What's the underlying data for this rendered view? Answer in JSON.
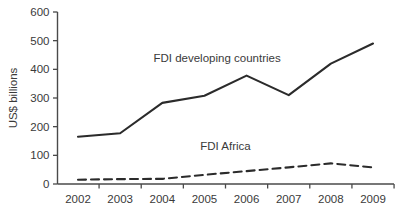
{
  "chart_data": {
    "type": "line",
    "title": "",
    "subtitle": "",
    "xlabel": "",
    "ylabel": "US$ billions",
    "categories": [
      "2002",
      "2003",
      "2004",
      "2005",
      "2006",
      "2007",
      "2008",
      "2009"
    ],
    "x": [
      2002,
      2003,
      2004,
      2005,
      2006,
      2007,
      2008,
      2009
    ],
    "ylim": [
      0,
      600
    ],
    "xlim": [
      2002,
      2009
    ],
    "yticks": [
      0,
      100,
      200,
      300,
      400,
      500,
      600
    ],
    "ytick_labels": [
      "0",
      "100",
      "200",
      "300",
      "400",
      "500",
      "600"
    ],
    "xtick_labels": [
      "2002",
      "2003",
      "2004",
      "2005",
      "2006",
      "2007",
      "2008",
      "2009"
    ],
    "grid": false,
    "legend_position": "inline-annotation",
    "series": [
      {
        "name": "FDI developing countries",
        "style": "solid",
        "color": "#2b2b2b",
        "values": [
          165,
          177,
          283,
          308,
          378,
          310,
          420,
          490
        ]
      },
      {
        "name": "FDI Africa",
        "style": "dashed",
        "color": "#2b2b2b",
        "values": [
          15,
          17,
          18,
          32,
          45,
          58,
          72,
          58
        ]
      }
    ],
    "annotations": [
      {
        "text": "FDI developing countries",
        "x": 2005.3,
        "y": 425
      },
      {
        "text": "FDI Africa",
        "x": 2005.5,
        "y": 118
      }
    ]
  }
}
